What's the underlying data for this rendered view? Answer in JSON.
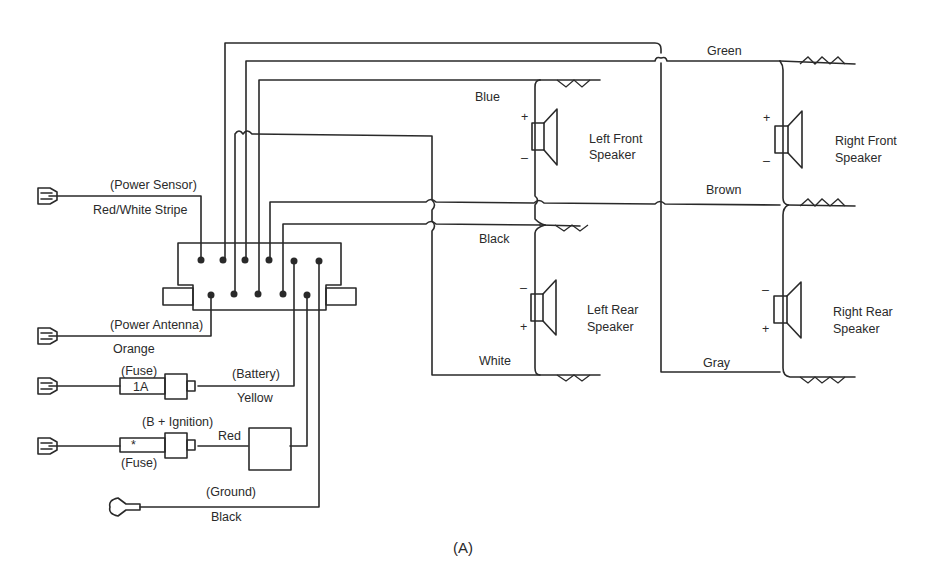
{
  "figure_label": "(A)",
  "radio_connector": {
    "name": "radio-connector",
    "pins_top": 6,
    "pins_bottom": 5
  },
  "input_wires": [
    {
      "id": "power-sensor",
      "function": "(Power Sensor)",
      "color": "Red/White Stripe"
    },
    {
      "id": "power-antenna",
      "function": "(Power Antenna)",
      "color": "Orange"
    },
    {
      "id": "battery",
      "function": "(Battery)",
      "color": "Yellow",
      "fuse_label": "(Fuse)",
      "fuse_rating": "1A"
    },
    {
      "id": "ignition",
      "function": "(B +  Ignition)",
      "color": "Red",
      "fuse_label": "(Fuse)",
      "fuse_rating": "*"
    },
    {
      "id": "ground",
      "function": "(Ground)",
      "color": "Black"
    }
  ],
  "speaker_wires": {
    "green": "Green",
    "blue": "Blue",
    "brown": "Brown",
    "black": "Black",
    "white": "White",
    "gray": "Gray"
  },
  "speakers": [
    {
      "id": "left-front",
      "line1": "Left Front",
      "line2": "Speaker",
      "top_pol": "+",
      "bottom_pol": "–"
    },
    {
      "id": "left-rear",
      "line1": "Left Rear",
      "line2": "Speaker",
      "top_pol": "–",
      "bottom_pol": "+"
    },
    {
      "id": "right-front",
      "line1": "Right Front",
      "line2": "Speaker",
      "top_pol": "+",
      "bottom_pol": "–"
    },
    {
      "id": "right-rear",
      "line1": "Right Rear",
      "line2": "Speaker",
      "top_pol": "–",
      "bottom_pol": "+"
    }
  ]
}
